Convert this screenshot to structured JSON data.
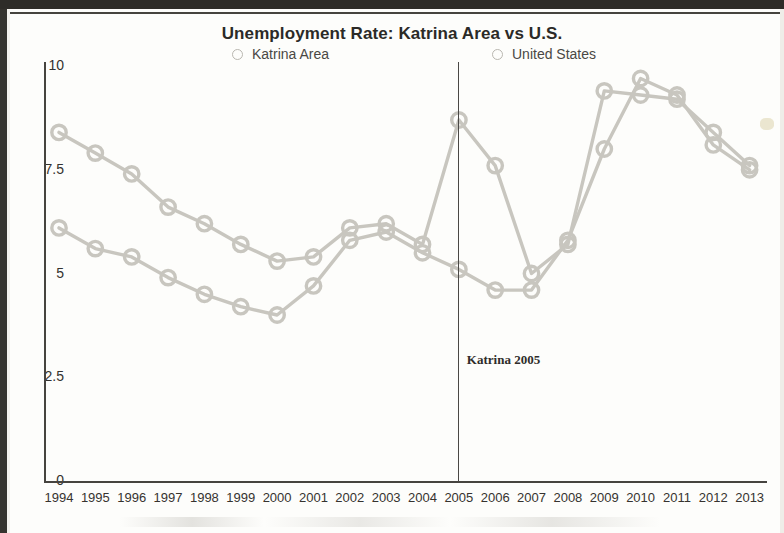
{
  "chart_data": {
    "type": "line",
    "title": "Unemployment Rate: Katrina Area vs U.S.",
    "xlabel": "",
    "ylabel": "",
    "grid": false,
    "legend_position": "top-center",
    "ylim": [
      0,
      10
    ],
    "yticks": [
      "0",
      "2.5",
      "5",
      "7.5",
      "10"
    ],
    "ytick_values": [
      0,
      2.5,
      5,
      7.5,
      10
    ],
    "categories": [
      "1994",
      "1995",
      "1996",
      "1997",
      "1998",
      "1999",
      "2000",
      "2001",
      "2002",
      "2003",
      "2004",
      "2005",
      "2006",
      "2007",
      "2008",
      "2009",
      "2010",
      "2011",
      "2012",
      "2013"
    ],
    "series": [
      {
        "name": "Katrina Area",
        "values": [
          8.4,
          7.9,
          7.4,
          6.6,
          6.2,
          5.7,
          5.3,
          5.4,
          6.1,
          6.2,
          5.7,
          8.7,
          7.6,
          5.0,
          5.7,
          9.4,
          9.3,
          9.2,
          8.4,
          7.6
        ]
      },
      {
        "name": "United States",
        "values": [
          6.1,
          5.6,
          5.4,
          4.9,
          4.5,
          4.2,
          4.0,
          4.7,
          5.8,
          6.0,
          5.5,
          5.1,
          4.6,
          4.6,
          5.8,
          8.0,
          9.7,
          9.3,
          8.1,
          7.5
        ]
      }
    ],
    "annotations": [
      {
        "text": "Katrina 2005",
        "x_category": "2005",
        "type": "vertical-line-label"
      }
    ],
    "colors": {
      "katrina_area": "#c8c6bf",
      "united_states": "#c8c6bf",
      "axis": "#46443f",
      "text": "#2b2a27",
      "annotation_line": "#4a4845"
    }
  },
  "axes": {
    "y_tick_labels": [
      "10",
      "7.5",
      "5",
      "2.5",
      "0"
    ],
    "x_tick_labels": [
      "1994",
      "1995",
      "1996",
      "1997",
      "1998",
      "1999",
      "2000",
      "2001",
      "2002",
      "2003",
      "2004",
      "2005",
      "2006",
      "2007",
      "2008",
      "2009",
      "2010",
      "2011",
      "2012",
      "2013"
    ]
  },
  "legend": {
    "entries": [
      {
        "label": "Katrina Area",
        "marker": "circle-open-icon"
      },
      {
        "label": "United States",
        "marker": "circle-open-icon"
      }
    ]
  },
  "annotation": {
    "katrina_label": "Katrina 2005"
  }
}
